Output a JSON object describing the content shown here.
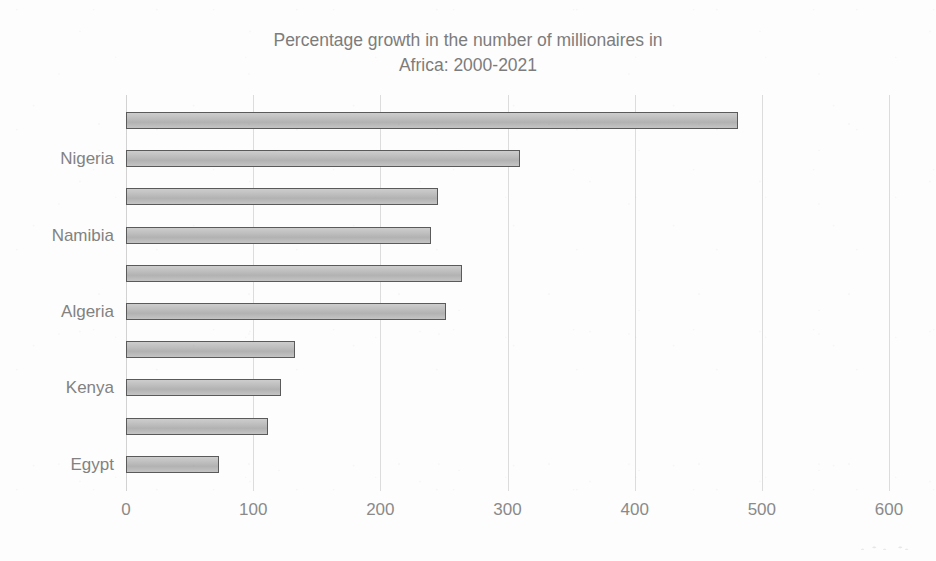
{
  "chart_data": {
    "type": "bar",
    "orientation": "horizontal",
    "title": "Percentage growth in the number of millionaires in\nAfrica: 2000-2021",
    "xlabel": "",
    "ylabel": "",
    "xlim": [
      0,
      600
    ],
    "xticks": [
      0,
      100,
      200,
      300,
      400,
      500,
      600
    ],
    "xtick_labels": [
      "0",
      "100",
      "200",
      "300",
      "400",
      "500",
      "600"
    ],
    "grid": true,
    "legend": false,
    "categories": [
      "",
      "Nigeria",
      "",
      "Namibia",
      "",
      "Algeria",
      "",
      "Kenya",
      "",
      "Egypt"
    ],
    "visible_category_labels": [
      "Nigeria",
      "Namibia",
      "Algeria",
      "Kenya",
      "Egypt"
    ],
    "values": [
      481,
      310,
      245,
      240,
      264,
      252,
      133,
      122,
      112,
      73
    ],
    "bar_fill_color": "#bdbdbd",
    "bar_border_color": "#5a5a5a",
    "grid_color": "#dcdcdc",
    "text_color": "#828282",
    "background_color": "#fdfdfd"
  },
  "chart": {
    "title": "Percentage growth in the number of millionaires in\nAfrica: 2000-2021"
  }
}
